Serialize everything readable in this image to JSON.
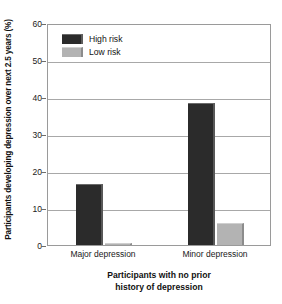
{
  "chart_data": {
    "type": "bar",
    "title": "",
    "subtitle": "",
    "categories": [
      "Major depression",
      "Minor depression"
    ],
    "series": [
      {
        "name": "High risk",
        "color": "#2b2b2b",
        "values": [
          16.5,
          38.5
        ]
      },
      {
        "name": "Low risk",
        "color": "#b3b3b3",
        "values": [
          0.5,
          6.0
        ]
      }
    ],
    "xlabel_lines": [
      "Participants with no prior",
      "history of depression"
    ],
    "xlabel": "Participants with no prior history of depression",
    "ylabel": "Participants developing depression over next 2.5 years (%)",
    "ylim": [
      0,
      60
    ],
    "ytick_values": [
      0,
      10,
      20,
      30,
      40,
      50,
      60
    ],
    "ytick_labels": [
      "0",
      "10",
      "20",
      "30",
      "40",
      "50",
      "60"
    ],
    "grid": "horizontal",
    "legend_position": "top-left"
  },
  "legend": {
    "items": [
      {
        "label": "High risk",
        "swatch": "high-risk-swatch"
      },
      {
        "label": "Low risk",
        "swatch": "low-risk-swatch"
      }
    ]
  }
}
